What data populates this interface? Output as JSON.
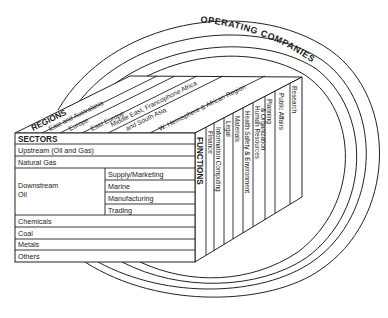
{
  "operating_companies": {
    "label": "OPERATING COMPANIES"
  },
  "regions": {
    "label": "REGIONS",
    "items": [
      "East and Australasia",
      "Europe",
      "East Europe",
      "Middle East, Francophone Africa",
      "and South Asia",
      "W. Hemisphere & African Region"
    ]
  },
  "sectors": {
    "label": "SECTORS",
    "rows": [
      {
        "label": "Upstream (Oil and Gas)"
      },
      {
        "label": "Natural Gas"
      },
      {
        "label": "Downstream Oil",
        "line1": "Downstream",
        "line2": "Oil",
        "sub": [
          "Supply/Marketing",
          "Marine",
          "Manufacturing",
          "Trading"
        ]
      },
      {
        "label": "Chemicals"
      },
      {
        "label": "Coal"
      },
      {
        "label": "Metals"
      },
      {
        "label": "Others"
      }
    ]
  },
  "functions": {
    "label": "FUNCTIONS",
    "items": [
      "Finance",
      "Information Computing",
      "Legal",
      "Materials",
      "Health Safety & Environment",
      "Human Resources",
      "& Organization",
      "Planning",
      "Public Affairs",
      "Research"
    ]
  },
  "colors": {
    "line": "#222222",
    "background": "#ffffff",
    "text": "#1a1a1a"
  }
}
